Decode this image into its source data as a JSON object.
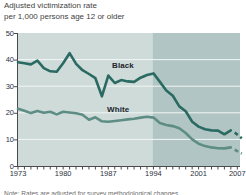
{
  "title": {
    "line1": "Adjusted victimization rate",
    "line2": "per 1,000 persons age 12 or older"
  },
  "note_clipped": "Note: Rates are adjusted for survey methodological changes.",
  "colors": {
    "plot_bg_light": "#cedbd9",
    "plot_bg_dark": "#b1c6c4",
    "black_series_line": "#2b6a62",
    "white_series_line": "#5e8d86",
    "gridline": "#f2f6f5",
    "axis": "#4a4a4a",
    "axis_text": "#2b3140"
  },
  "chart_data": {
    "type": "line",
    "title": "Adjusted victimization rate per 1,000 persons age 12 or older",
    "xlabel": "",
    "ylabel": "",
    "xlim": [
      1973,
      2007
    ],
    "ylim": [
      0,
      50
    ],
    "y_ticks": [
      0,
      10,
      20,
      30,
      40,
      50
    ],
    "x_tick_labels": [
      1973,
      1980,
      1987,
      1994,
      2001,
      2007
    ],
    "x_minor_ticks_every_year": true,
    "grid": "horizontal-white",
    "shaded_region": {
      "from": 1994,
      "to": 2007,
      "note": "darker background band"
    },
    "legend_position": "inline-labels",
    "series": [
      {
        "name": "Black",
        "label_pos": {
          "x": 112,
          "y": 61
        },
        "points": [
          [
            1973,
            39.0
          ],
          [
            1974,
            38.6
          ],
          [
            1975,
            38.2
          ],
          [
            1976,
            39.6
          ],
          [
            1977,
            36.8
          ],
          [
            1978,
            35.6
          ],
          [
            1979,
            35.4
          ],
          [
            1980,
            38.6
          ],
          [
            1981,
            42.4
          ],
          [
            1982,
            38.4
          ],
          [
            1983,
            36.0
          ],
          [
            1984,
            34.6
          ],
          [
            1985,
            33.0
          ],
          [
            1986,
            26.2
          ],
          [
            1987,
            34.0
          ],
          [
            1988,
            31.2
          ],
          [
            1989,
            32.3
          ],
          [
            1990,
            31.8
          ],
          [
            1991,
            31.6
          ],
          [
            1992,
            33.2
          ],
          [
            1993,
            34.2
          ],
          [
            1994,
            34.8
          ],
          [
            1995,
            31.6
          ],
          [
            1996,
            28.4
          ],
          [
            1997,
            26.4
          ],
          [
            1998,
            22.4
          ],
          [
            1999,
            20.6
          ],
          [
            2000,
            16.6
          ],
          [
            2001,
            14.8
          ],
          [
            2002,
            13.8
          ],
          [
            2003,
            13.4
          ],
          [
            2004,
            13.3
          ],
          [
            2005,
            11.9
          ],
          [
            2006,
            13.4
          ]
        ],
        "dashed_end_segment": [
          [
            2006.6,
            12.6
          ],
          [
            2007.7,
            10.4
          ]
        ]
      },
      {
        "name": "White",
        "label_pos": {
          "x": 107,
          "y": 105
        },
        "points": [
          [
            1973,
            21.5
          ],
          [
            1974,
            20.8
          ],
          [
            1975,
            19.9
          ],
          [
            1976,
            20.7
          ],
          [
            1977,
            20.0
          ],
          [
            1978,
            20.4
          ],
          [
            1979,
            19.4
          ],
          [
            1980,
            20.4
          ],
          [
            1981,
            20.1
          ],
          [
            1982,
            19.8
          ],
          [
            1983,
            19.3
          ],
          [
            1984,
            17.4
          ],
          [
            1985,
            18.3
          ],
          [
            1986,
            16.8
          ],
          [
            1987,
            16.6
          ],
          [
            1988,
            16.9
          ],
          [
            1989,
            17.2
          ],
          [
            1990,
            17.5
          ],
          [
            1991,
            17.8
          ],
          [
            1992,
            18.2
          ],
          [
            1993,
            18.5
          ],
          [
            1994,
            18.2
          ],
          [
            1995,
            16.2
          ],
          [
            1996,
            15.4
          ],
          [
            1997,
            15.0
          ],
          [
            1998,
            14.2
          ],
          [
            1999,
            12.4
          ],
          [
            2000,
            10.0
          ],
          [
            2001,
            8.4
          ],
          [
            2002,
            7.5
          ],
          [
            2003,
            7.0
          ],
          [
            2004,
            6.7
          ],
          [
            2005,
            6.6
          ],
          [
            2006,
            7.0
          ]
        ],
        "dashed_end_segment": [
          [
            2006.6,
            6.1
          ],
          [
            2007.7,
            4.7
          ]
        ]
      }
    ]
  }
}
